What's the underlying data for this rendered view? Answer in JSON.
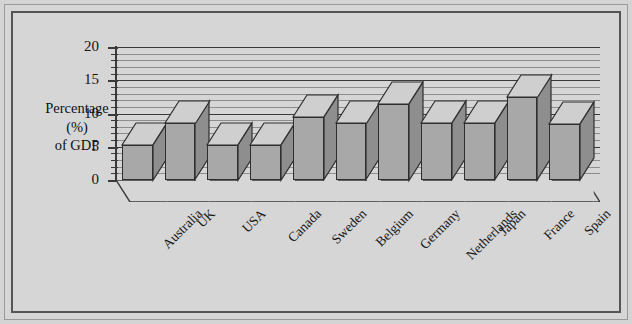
{
  "chart_data": {
    "type": "bar",
    "title": "",
    "subtitle": "",
    "xlabel": "",
    "ylabel": "Percentage (%) of GDP",
    "ylabel_lines": [
      "Percentage",
      "(%)",
      "of GDP"
    ],
    "categories": [
      "Australia",
      "UK",
      "USA",
      "Canada",
      "Sweden",
      "Belgium",
      "Germany",
      "Netherlands",
      "Japan",
      "France",
      "Spain"
    ],
    "values": [
      5.3,
      8.5,
      5.3,
      5.3,
      9.4,
      8.5,
      11.5,
      8.5,
      8.5,
      12.5,
      8.4
    ],
    "ylim": [
      0,
      20
    ],
    "ytick_labels": [
      "0",
      "5",
      "10",
      "15",
      "20"
    ],
    "ytick_values": [
      0,
      5,
      10,
      15,
      20
    ],
    "minor_tick_step": 1,
    "grid": true,
    "legend": "none",
    "style": "3d-column",
    "colors": {
      "bar_front": "#a8a8a8",
      "bar_side": "#8e8e8e",
      "bar_top": "#cfcfcf",
      "outline": "#2e2e2e",
      "gridline": "#8d8d8d",
      "gridline_major": "#3a3a3a",
      "background": "#d6d6d6",
      "frame": "#555555",
      "text": "#151515"
    }
  }
}
